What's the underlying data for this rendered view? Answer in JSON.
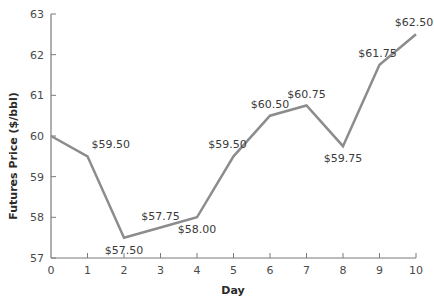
{
  "chart_data": {
    "type": "line",
    "title": "",
    "xlabel": "Day",
    "ylabel": "Futures Price ($/bbl)",
    "x": [
      0,
      1,
      2,
      3,
      4,
      5,
      6,
      7,
      8,
      9,
      10
    ],
    "series": [
      {
        "name": "Futures Price",
        "points": [
          {
            "x": 0,
            "y": 60.0,
            "label": ""
          },
          {
            "x": 1,
            "y": 59.5,
            "label": "$59.50"
          },
          {
            "x": 2,
            "y": 57.5,
            "label": "$57.50"
          },
          {
            "x": 3,
            "y": 57.75,
            "label": "$57.75"
          },
          {
            "x": 4,
            "y": 58.0,
            "label": "$58.00"
          },
          {
            "x": 5,
            "y": 59.5,
            "label": "$59.50"
          },
          {
            "x": 6,
            "y": 60.5,
            "label": "$60.50"
          },
          {
            "x": 7,
            "y": 60.75,
            "label": "$60.75"
          },
          {
            "x": 8,
            "y": 59.75,
            "label": "$59.75"
          },
          {
            "x": 9,
            "y": 61.75,
            "label": "$61.75"
          },
          {
            "x": 10,
            "y": 62.5,
            "label": "$62.50"
          }
        ],
        "color": "#8c8c8c"
      }
    ],
    "xlim": [
      0,
      10
    ],
    "ylim": [
      57,
      63
    ],
    "xticks": [
      "0",
      "1",
      "2",
      "3",
      "4",
      "5",
      "6",
      "7",
      "8",
      "9",
      "10"
    ],
    "yticks": [
      "57",
      "58",
      "59",
      "60",
      "61",
      "62",
      "63"
    ],
    "grid": false,
    "legend": "none",
    "axis_color": "#7a7a7a"
  }
}
